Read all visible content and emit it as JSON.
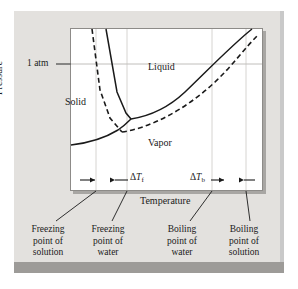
{
  "figure": {
    "axes": {
      "x_label": "Temperature",
      "y_label": "Pressure",
      "pressure_gridline_label": "1 atm"
    },
    "regions": [
      {
        "name": "solid-region-label",
        "label": "Solid"
      },
      {
        "name": "liquid-region-label",
        "label": "Liquid"
      },
      {
        "name": "vapor-region-label",
        "label": "Vapor"
      }
    ],
    "annotations": {
      "freezing_depression": {
        "delta": "Δ",
        "symbol": "T",
        "subscript": "f"
      },
      "boiling_elevation": {
        "delta": "Δ",
        "symbol": "T",
        "subscript": "b"
      }
    },
    "callouts": [
      {
        "name": "callout-freezing-point-solution",
        "line1": "Freezing",
        "line2": "point of",
        "line3": "solution"
      },
      {
        "name": "callout-freezing-point-water",
        "line1": "Freezing",
        "line2": "point of",
        "line3": "water"
      },
      {
        "name": "callout-boiling-point-water",
        "line1": "Boiling",
        "line2": "point of",
        "line3": "water"
      },
      {
        "name": "callout-boiling-point-solution",
        "line1": "Boiling",
        "line2": "point of",
        "line3": "solution"
      }
    ],
    "colors": {
      "outer_frame": "#c9c9c9",
      "panel_background": "#e3e1de",
      "plot_background": "#ffffff",
      "bottom_bar": "#9d9b98",
      "curve": "#1a1a1a",
      "gridline": "#d2d0cd",
      "text": "#1a1a1a"
    },
    "curves": [
      {
        "name": "water-solid-liquid-boundary",
        "style": "solid",
        "substance": "water"
      },
      {
        "name": "water-liquid-vapor-boundary",
        "style": "solid",
        "substance": "water"
      },
      {
        "name": "water-sublimation-boundary",
        "style": "solid",
        "substance": "water"
      },
      {
        "name": "solution-solid-liquid-boundary",
        "style": "dashed",
        "substance": "solution"
      },
      {
        "name": "solution-liquid-vapor-boundary",
        "style": "dashed",
        "substance": "solution"
      }
    ],
    "gridlines": {
      "vertical_count": 4,
      "vertical_meaning": [
        "freezing point of solution",
        "freezing point of water",
        "boiling point of water",
        "boiling point of solution"
      ],
      "horizontal_count": 1,
      "horizontal_meaning": [
        "1 atm"
      ]
    }
  }
}
